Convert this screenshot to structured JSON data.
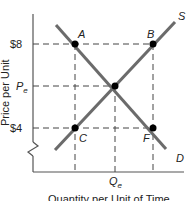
{
  "diagram": {
    "title": "",
    "y_axis_label": "Price per Unit",
    "x_axis_label": "Quantity per Unit of Time",
    "y_ticks": {
      "high": "$8",
      "eq_main": "P",
      "eq_sub": "e",
      "low": "$4"
    },
    "x_ticks": {
      "eq_main": "Q",
      "eq_sub": "e"
    },
    "curves": {
      "supply": "S",
      "demand": "D"
    },
    "points": {
      "A": "A",
      "B": "B",
      "C": "C",
      "F": "F"
    },
    "colors": {
      "curve": "#6b6b6b",
      "axis": "#555555",
      "point": "#000000",
      "dashed": "#444444"
    }
  }
}
